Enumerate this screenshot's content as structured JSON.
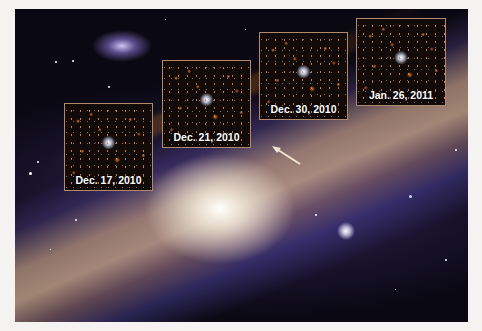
{
  "figure": {
    "insets": [
      {
        "label": "Dec. 17, 2010"
      },
      {
        "label": "Dec. 21, 2010"
      },
      {
        "label": "Dec. 30, 2010"
      },
      {
        "label": "Jan. 26, 2011"
      }
    ],
    "colors": {
      "page_background": "#f4f3f1",
      "space": "#0a0812",
      "inset_border": "#b08a6a",
      "label_text": "#ffffff",
      "arrow": "#f2e6d0"
    }
  }
}
